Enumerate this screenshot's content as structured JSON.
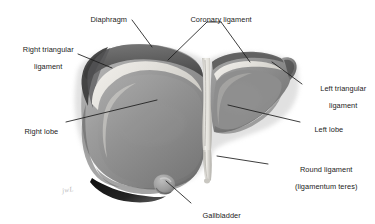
{
  "figure": {
    "background_color": "#ffffff",
    "ink_color": "#1b1b1b",
    "artist_mark": "jwL"
  },
  "labels": [
    {
      "name": "diaphragm",
      "lines": [
        "Diaphragm"
      ],
      "x": 82,
      "y": 9,
      "align": "left",
      "leader": [
        [
          132,
          20
        ],
        [
          152,
          47
        ]
      ]
    },
    {
      "name": "right-triangular-ligament",
      "lines": [
        "Right triangular",
        "ligament"
      ],
      "x": 6,
      "y": 38,
      "align": "left",
      "leader": [
        [
          78,
          54
        ],
        [
          112,
          68
        ]
      ]
    },
    {
      "name": "coronary-ligament",
      "lines": [
        "Coronary ligament"
      ],
      "x": 182,
      "y": 9,
      "align": "left",
      "leader": [
        [
          207,
          22
        ],
        [
          168,
          60
        ]
      ],
      "leader2": [
        [
          221,
          22
        ],
        [
          250,
          62
        ]
      ]
    },
    {
      "name": "left-triangular-ligament",
      "lines": [
        "Left triangular",
        "ligament"
      ],
      "x": 305,
      "y": 78,
      "align": "left",
      "leader": [
        [
          302,
          84
        ],
        [
          272,
          62
        ]
      ]
    },
    {
      "name": "left-lobe",
      "lines": [
        "Left lobe"
      ],
      "x": 305,
      "y": 118,
      "align": "left",
      "leader": [
        [
          300,
          122
        ],
        [
          228,
          105
        ]
      ]
    },
    {
      "name": "round-ligament",
      "lines": [
        "Round ligament",
        "(ligamentum teres)"
      ],
      "x": 272,
      "y": 158,
      "align": "left",
      "leader": [
        [
          268,
          164
        ],
        [
          217,
          156
        ]
      ]
    },
    {
      "name": "right-lobe",
      "lines": [
        "Right lobe"
      ],
      "x": 16,
      "y": 120,
      "align": "left",
      "leader": [
        [
          66,
          122
        ],
        [
          157,
          100
        ]
      ]
    },
    {
      "name": "gallbladder",
      "lines": [
        "Gallbladder"
      ],
      "x": 194,
      "y": 204,
      "align": "left",
      "leader": [
        [
          191,
          203
        ],
        [
          166,
          181
        ]
      ]
    }
  ],
  "structures": [
    {
      "name": "right-lobe-body",
      "tone": "#8e8e8e"
    },
    {
      "name": "left-lobe-body",
      "tone": "#868686"
    },
    {
      "name": "coronary-ligament-band",
      "tone": "#e6e4e0"
    },
    {
      "name": "falciform-ligament",
      "tone": "#e9e7e2"
    },
    {
      "name": "round-ligament-cord",
      "tone": "#dcdad5"
    },
    {
      "name": "gallbladder-body",
      "tone": "#a0a0a0"
    },
    {
      "name": "inferior-shadow",
      "tone": "#1c1c1c"
    }
  ]
}
